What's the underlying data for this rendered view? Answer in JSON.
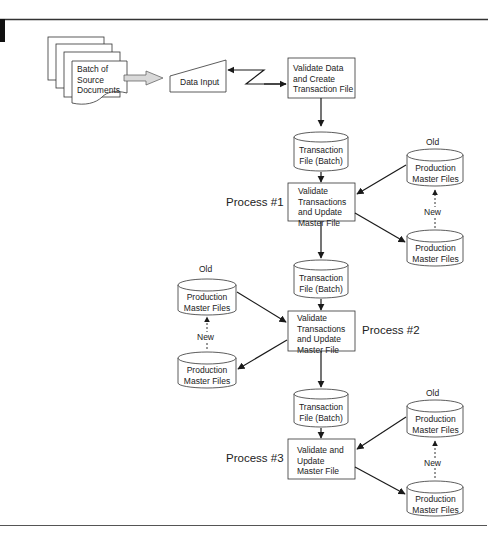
{
  "diagram": {
    "title": "",
    "source": {
      "batch_docs": "Batch of\nSource\nDocuments",
      "data_input": "Data Input",
      "validate_create": [
        "Validate Data",
        "and Create",
        "Transaction File"
      ]
    },
    "transaction_file": [
      "Transaction",
      "File (Batch)"
    ],
    "master_file": [
      "Production",
      "Master Files"
    ],
    "old_label": "Old",
    "new_label": "New",
    "processes": [
      {
        "label": "Process #1",
        "box": [
          "Validate",
          "Transactions",
          "and Update",
          "Master File"
        ],
        "masters_side": "right"
      },
      {
        "label": "Process #2",
        "box": [
          "Validate",
          "Transactions",
          "and Update",
          "Master File"
        ],
        "masters_side": "left"
      },
      {
        "label": "Process #3",
        "box": [
          "Validate and",
          "Update",
          "Master File"
        ],
        "masters_side": "right"
      }
    ],
    "colors": {
      "line": "#1a1a1a",
      "arrow_fill": "#d9d9d9",
      "rule": "#444444"
    }
  }
}
